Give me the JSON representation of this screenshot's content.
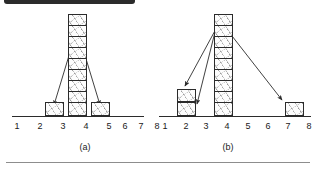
{
  "figure": {
    "kind": "two-panel line drawing of stacked unit blocks over a number line",
    "panels": [
      {
        "id": "a",
        "caption": "(a)",
        "axis": {
          "ticks": [
            "1",
            "2",
            "3",
            "4",
            "5",
            "6",
            "7",
            "8"
          ],
          "min": 1,
          "max": 8
        },
        "stacks": [
          {
            "position": 3,
            "count": 1
          },
          {
            "position": 4,
            "count": 9
          },
          {
            "position": 5,
            "count": 1
          }
        ],
        "arrows": [
          {
            "from_position": 4,
            "from_level": 8,
            "to_position": 3,
            "to_level": 1
          },
          {
            "from_position": 4,
            "from_level": 8,
            "to_position": 5,
            "to_level": 1
          }
        ]
      },
      {
        "id": "b",
        "caption": "(b)",
        "axis": {
          "ticks": [
            "1",
            "2",
            "3",
            "4",
            "5",
            "6",
            "7",
            "8"
          ],
          "min": 1,
          "max": 8
        },
        "stacks": [
          {
            "position": 2,
            "count": 2
          },
          {
            "position": 4,
            "count": 9
          },
          {
            "position": 8,
            "count": 1
          }
        ],
        "arrows": [
          {
            "from_position": 4,
            "from_level": 8,
            "to_position": 2,
            "to_level": 2
          },
          {
            "from_position": 4,
            "from_level": 8,
            "to_position": 2,
            "to_level": 1
          },
          {
            "from_position": 4,
            "from_level": 8,
            "to_position": 8,
            "to_level": 1
          }
        ]
      }
    ]
  },
  "colors": {
    "ink": "#2b2b2b",
    "text": "#1a1a1a",
    "paper": "#ffffff",
    "rule": "#8d8d8d"
  }
}
